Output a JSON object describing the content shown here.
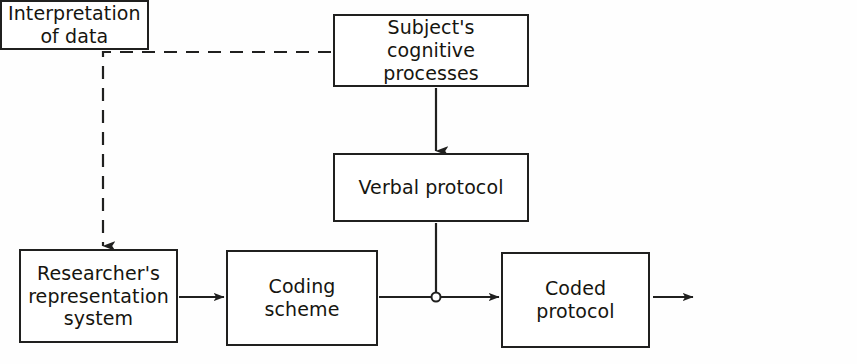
{
  "diagram": {
    "canvas": {
      "width": 857,
      "height": 364
    },
    "colors": {
      "background": "#fefefe",
      "stroke": "#20201f",
      "text": "#16150f",
      "node_fill": "#ffffff"
    },
    "nodes": [
      {
        "id": "subject",
        "label": "Subject's cognitive\nprocesses",
        "x": 333,
        "y": 14,
        "width": 196,
        "height": 73
      },
      {
        "id": "verbal",
        "label": "Verbal protocol",
        "x": 333,
        "y": 153,
        "width": 196,
        "height": 69
      },
      {
        "id": "researcher",
        "label": "Researcher's\nrepresentation\nsystem",
        "x": 19,
        "y": 249,
        "width": 159,
        "height": 94
      },
      {
        "id": "coding",
        "label": "Coding\nscheme",
        "x": 226,
        "y": 250,
        "width": 152,
        "height": 96
      },
      {
        "id": "coded",
        "label": "Coded\nprotocol",
        "x": 501,
        "y": 252,
        "width": 149,
        "height": 96
      },
      {
        "id": "interpretation",
        "label": "Interpretation\nof data",
        "x": 695,
        "y": 252,
        "width": 140,
        "height": 96
      }
    ],
    "edges": [
      {
        "id": "subject-to-verbal",
        "from": "subject",
        "to": "verbal",
        "style": "solid",
        "arrow": true,
        "label": ""
      },
      {
        "id": "subject-to-researcher",
        "from": "subject",
        "to": "researcher",
        "style": "dashed",
        "arrow": true,
        "label": ""
      },
      {
        "id": "researcher-to-coding",
        "from": "researcher",
        "to": "coding",
        "style": "solid",
        "arrow": true,
        "label": ""
      },
      {
        "id": "coding-to-coded",
        "from": "coding",
        "to": "coded",
        "style": "solid",
        "arrow": true,
        "label": ""
      },
      {
        "id": "verbal-to-junction",
        "from": "verbal",
        "to": "junction",
        "style": "solid",
        "arrow": false,
        "label": ""
      },
      {
        "id": "coded-to-interpretation",
        "from": "coded",
        "to": "interpretation",
        "style": "solid",
        "arrow": true,
        "label": ""
      }
    ],
    "junction": {
      "id": "merge-junction",
      "x": 436,
      "y": 297,
      "radius": 4.5,
      "label": ""
    }
  }
}
